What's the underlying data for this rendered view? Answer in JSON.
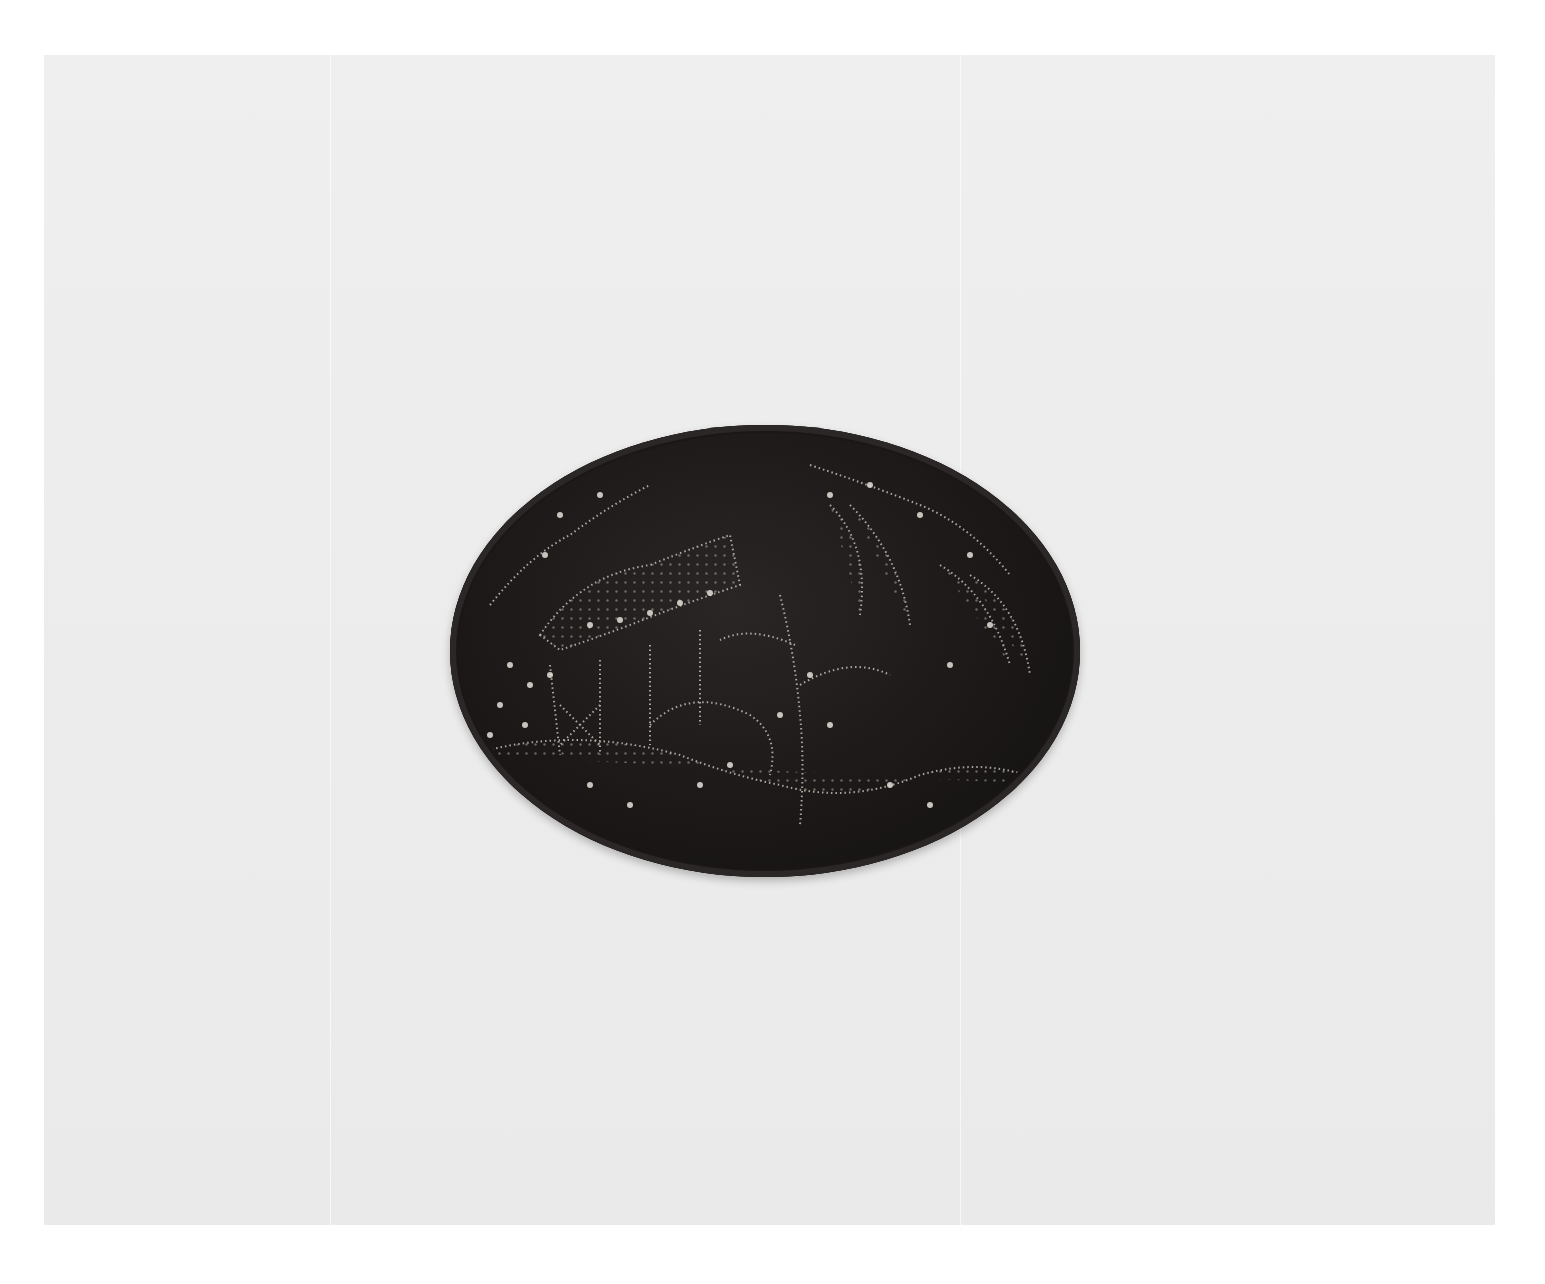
{
  "image": {
    "subject": "Dark oval lidded box with pique dotted inlay",
    "motifs": [
      "pagoda",
      "flowering branches",
      "tree",
      "rocks",
      "leaves"
    ],
    "background_color": "#ececec",
    "object_color": "#1b1817",
    "inlay_color": "#d8d4cc"
  }
}
